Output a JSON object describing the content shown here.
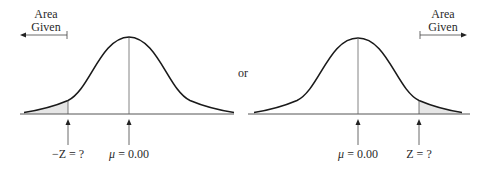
{
  "left_panel": {
    "area_label_line1": "Area",
    "area_label_line2": "Given",
    "area_arrow_direction": "left",
    "tail_shaded": "left",
    "z_label": "−Z = ?",
    "mean_symbol": "μ",
    "mean_label_rest": " = 0.00"
  },
  "connector": {
    "text": "or"
  },
  "right_panel": {
    "area_label_line1": "Area",
    "area_label_line2": "Given",
    "area_arrow_direction": "right",
    "tail_shaded": "right",
    "z_label": "Z = ?",
    "mean_symbol": "μ",
    "mean_label_rest": " = 0.00"
  },
  "colors": {
    "curve": "#1a1a1a",
    "shade": "#e6e6e6",
    "axis": "#555555"
  }
}
